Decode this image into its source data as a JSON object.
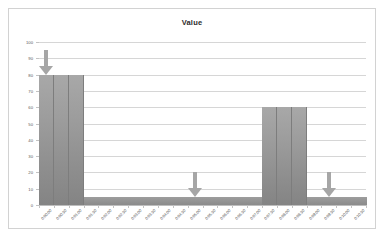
{
  "chart": {
    "title": "Value",
    "background": "#ffffff",
    "border_color": "#d2d2d2",
    "bar_color": "#9b9b9b",
    "arrow_color": "#a6a6a6",
    "grid_color": "#d6d6d6",
    "axis_text_color": "#4d4d4d"
  },
  "chart_data": {
    "type": "bar",
    "title": "Value",
    "xlabel": "",
    "ylabel": "",
    "ylim": [
      0,
      100
    ],
    "yticks": [
      0,
      10,
      20,
      30,
      40,
      50,
      60,
      70,
      80,
      90,
      100
    ],
    "grid": true,
    "legend": false,
    "categories": [
      "0:00:00",
      "0:00:30",
      "0:01:00",
      "0:01:30",
      "0:02:00",
      "0:02:30",
      "0:03:00",
      "0:03:30",
      "0:04:00",
      "0:04:30",
      "0:05:00",
      "0:05:30",
      "0:06:00",
      "0:06:30",
      "0:07:00",
      "0:07:30",
      "0:08:00",
      "0:08:30",
      "0:09:00",
      "0:09:30",
      "0:10:00",
      "0:10:30"
    ],
    "values": [
      80,
      80,
      80,
      5,
      5,
      5,
      5,
      5,
      5,
      5,
      5,
      5,
      5,
      5,
      5,
      60,
      60,
      60,
      5,
      5,
      5,
      5
    ],
    "annotations": [
      {
        "label": "arrow-1",
        "shape": "down-arrow",
        "category": "0:00:00",
        "y_top": 95,
        "y_tip": 80
      },
      {
        "label": "arrow-2",
        "shape": "down-arrow",
        "category": "0:05:00",
        "y_top": 20,
        "y_tip": 5
      },
      {
        "label": "arrow-3",
        "shape": "down-arrow",
        "category": "0:09:30",
        "y_top": 20,
        "y_tip": 5
      }
    ]
  }
}
